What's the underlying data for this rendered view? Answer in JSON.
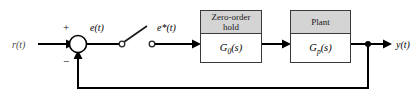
{
  "diagram": {
    "type": "sampled-data-control-block-diagram",
    "background_color": "#ffffff",
    "line_color": "#000000",
    "header_fill_color": "#d4d4d4",
    "block_border_color": "#3a3a3a",
    "signals": {
      "reference_input": "r(t)",
      "error": "e(t)",
      "sampled_error": "e*(t)",
      "output": "y(t)"
    },
    "summing_junction": {
      "name": "summing-junction",
      "positive_sign": "+",
      "negative_sign": "−",
      "positive_input": "r(t)",
      "negative_input": "y(t)"
    },
    "sampler": {
      "name": "sampler-switch",
      "state": "open",
      "input": "e(t)",
      "output": "e*(t)"
    },
    "blocks": [
      {
        "id": "zero-order-hold",
        "title_line_1": "Zero-order",
        "title_line_2": "hold",
        "transfer_function_base": "G",
        "transfer_function_sub": "0",
        "transfer_function_arg": "(s)"
      },
      {
        "id": "plant",
        "title_line_1": "Plant",
        "title_line_2": "",
        "transfer_function_base": "G",
        "transfer_function_sub": "p",
        "transfer_function_arg": "(s)"
      }
    ],
    "feedback": {
      "name": "unity-feedback-path",
      "gain": "1",
      "takeoff_signal": "y(t)"
    }
  }
}
